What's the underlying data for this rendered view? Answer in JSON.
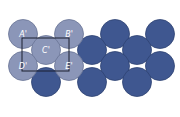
{
  "diagram": {
    "type": "close-packed atom layer",
    "colors": {
      "highlight_fill": "#8b96b8",
      "highlight_stroke": "#6a7596",
      "atom_fill": "#3f5790",
      "atom_stroke": "#2f4372",
      "cell_outline": "#1a1f2e",
      "background": "#ffffff"
    },
    "radius": 14.5,
    "atoms": [
      {
        "x": 23,
        "y": 34,
        "kind": "highlight",
        "label": "A'"
      },
      {
        "x": 69,
        "y": 34,
        "kind": "highlight",
        "label": "B'"
      },
      {
        "x": 46,
        "y": 50,
        "kind": "highlight",
        "label": "C'"
      },
      {
        "x": 23,
        "y": 66,
        "kind": "highlight",
        "label": "D'"
      },
      {
        "x": 69,
        "y": 66,
        "kind": "highlight",
        "label": "E'"
      },
      {
        "x": 115,
        "y": 34,
        "kind": "atom",
        "label": ""
      },
      {
        "x": 160,
        "y": 34,
        "kind": "atom",
        "label": ""
      },
      {
        "x": 92,
        "y": 50,
        "kind": "atom",
        "label": ""
      },
      {
        "x": 137,
        "y": 50,
        "kind": "atom",
        "label": ""
      },
      {
        "x": 115,
        "y": 66,
        "kind": "atom",
        "label": ""
      },
      {
        "x": 160,
        "y": 66,
        "kind": "atom",
        "label": ""
      },
      {
        "x": 46,
        "y": 82,
        "kind": "atom",
        "label": ""
      },
      {
        "x": 92,
        "y": 82,
        "kind": "atom",
        "label": ""
      },
      {
        "x": 137,
        "y": 82,
        "kind": "atom",
        "label": ""
      }
    ],
    "unit_cell": {
      "x": 22,
      "y": 38,
      "width": 47,
      "height": 33
    }
  }
}
